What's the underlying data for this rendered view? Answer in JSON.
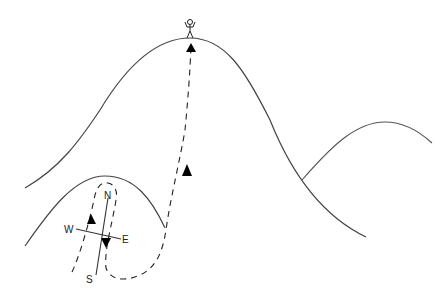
{
  "diagram": {
    "compass": {
      "north": "N",
      "south": "S",
      "east": "E",
      "west": "W"
    },
    "colors": {
      "line": "#444444",
      "path": "#222222",
      "arrow": "#000000",
      "background": "#ffffff"
    }
  }
}
